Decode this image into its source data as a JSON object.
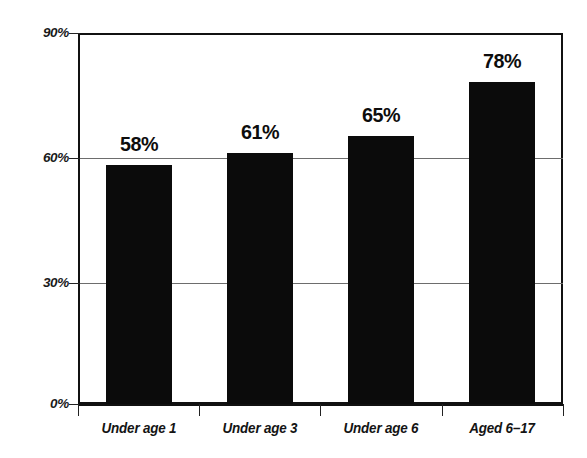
{
  "chart_data": {
    "type": "bar",
    "title": "",
    "subtitle": "",
    "xlabel": "",
    "ylabel": "",
    "categories": [
      "Under age 1",
      "Under age 3",
      "Under age 6",
      "Aged 6–17"
    ],
    "values": [
      58,
      61,
      65,
      78
    ],
    "value_labels": [
      "58%",
      "61%",
      "65%",
      "78%"
    ],
    "ylim": [
      0,
      90
    ],
    "yticks": [
      0,
      30,
      60,
      90
    ],
    "ytick_labels": [
      "0%",
      "30%",
      "60%",
      "90%"
    ],
    "grid": "horizontal",
    "gridlines_at": [
      30,
      60
    ],
    "legend": "none",
    "series": [
      {
        "name": "",
        "values": [
          58,
          61,
          65,
          78
        ]
      }
    ],
    "bar_color": "#0b0b0b",
    "axis_color": "#111111",
    "gridline_color": "#6d6d6d",
    "background_color": "#ffffff"
  },
  "axis": {
    "y": {
      "ticks": [
        {
          "label": "90%",
          "value": 90
        },
        {
          "label": "60%",
          "value": 60
        },
        {
          "label": "30%",
          "value": 30
        },
        {
          "label": "0%",
          "value": 0
        }
      ]
    },
    "x": {
      "ticks": [
        {
          "label": "Under age 1"
        },
        {
          "label": "Under age 3"
        },
        {
          "label": "Under age 6"
        },
        {
          "label": "Aged 6–17"
        }
      ]
    }
  }
}
